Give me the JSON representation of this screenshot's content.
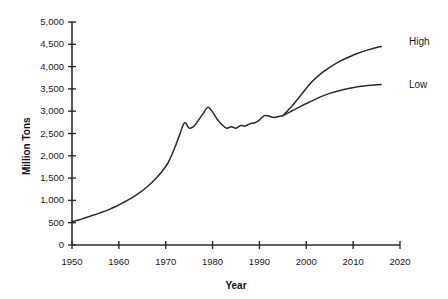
{
  "chart_data": {
    "type": "line",
    "title": "",
    "xlabel": "Year",
    "ylabel": "Million Tons",
    "xlim": [
      1950,
      2020
    ],
    "ylim": [
      0,
      5000
    ],
    "grid": false,
    "legend_position": "right-of-plot-inline",
    "xticks": [
      "1950",
      "1960",
      "1970",
      "1980",
      "1990",
      "2000",
      "2010",
      "2020"
    ],
    "xtick_values": [
      1950,
      1960,
      1970,
      1980,
      1990,
      2000,
      2010,
      2020
    ],
    "yticks": [
      "0",
      "500",
      "1,000",
      "1,500",
      "2,000",
      "2,500",
      "3,000",
      "3,500",
      "4,000",
      "4,500",
      "5,000"
    ],
    "ytick_values": [
      0,
      500,
      1000,
      1500,
      2000,
      2500,
      3000,
      3500,
      4000,
      4500,
      5000
    ],
    "line_color": "#2b2b2b",
    "series": [
      {
        "name": "Historical",
        "label": "",
        "x": [
          1950,
          1952,
          1954,
          1956,
          1958,
          1960,
          1962,
          1964,
          1966,
          1968,
          1970,
          1971,
          1972,
          1973,
          1974,
          1975,
          1976,
          1977,
          1978,
          1979,
          1980,
          1981,
          1982,
          1983,
          1984,
          1985,
          1986,
          1987,
          1988,
          1989,
          1990,
          1991,
          1992,
          1993,
          1994,
          1995
        ],
        "values": [
          520,
          580,
          650,
          720,
          800,
          900,
          1010,
          1140,
          1300,
          1500,
          1760,
          1950,
          2200,
          2480,
          2740,
          2620,
          2660,
          2800,
          2950,
          3090,
          2980,
          2820,
          2700,
          2620,
          2650,
          2620,
          2680,
          2670,
          2720,
          2740,
          2800,
          2900,
          2890,
          2860,
          2880,
          2900
        ]
      },
      {
        "name": "High",
        "label": "High",
        "x": [
          1995,
          1997,
          1999,
          2001,
          2003,
          2005,
          2007,
          2009,
          2011,
          2013,
          2015,
          2016
        ],
        "values": [
          2900,
          3120,
          3380,
          3640,
          3830,
          3980,
          4110,
          4210,
          4300,
          4370,
          4430,
          4450
        ]
      },
      {
        "name": "Low",
        "label": "Low",
        "x": [
          1995,
          1997,
          1999,
          2001,
          2003,
          2005,
          2007,
          2009,
          2011,
          2013,
          2015,
          2016
        ],
        "values": [
          2900,
          3010,
          3120,
          3220,
          3320,
          3400,
          3460,
          3510,
          3550,
          3575,
          3595,
          3600
        ]
      }
    ]
  },
  "annotations": {
    "high_label": "High",
    "low_label": "Low"
  }
}
